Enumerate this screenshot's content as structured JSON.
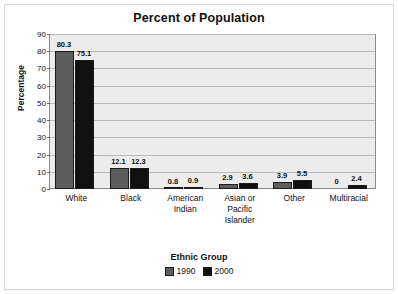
{
  "chart_data": {
    "type": "bar",
    "title": "Percent of Population",
    "xlabel": "Ethnic Group",
    "ylabel": "Percentage",
    "ylim": [
      0,
      90
    ],
    "yticks": [
      0,
      10,
      20,
      30,
      40,
      50,
      60,
      70,
      80,
      90
    ],
    "grid": true,
    "legend_position": "bottom",
    "categories": [
      "White",
      "Black",
      "American Indian",
      "Asian or Pacific Islander",
      "Other",
      "Multiracial"
    ],
    "category_lines": [
      [
        "White"
      ],
      [
        "Black"
      ],
      [
        "American",
        "Indian"
      ],
      [
        "Asian or",
        "Pacific",
        "Islander"
      ],
      [
        "Other"
      ],
      [
        "Multiracial"
      ]
    ],
    "series": [
      {
        "name": "1990",
        "color": "#5d5d5d",
        "values": [
          80.3,
          12.1,
          0.8,
          2.9,
          3.9,
          0
        ],
        "labels": [
          "80.3",
          "12.1",
          "0.8",
          "2.9",
          "3.9",
          "0"
        ]
      },
      {
        "name": "2000",
        "color": "#111111",
        "values": [
          75.1,
          12.3,
          0.9,
          3.6,
          5.5,
          2.4
        ],
        "labels": [
          "75.1",
          "12.3",
          "0.9",
          "3.6",
          "5.5",
          "2.4"
        ]
      }
    ]
  },
  "colors": {
    "series_1990": "#5d5d5d",
    "series_2000": "#111111",
    "plot_background": "#ececec",
    "gridline": "#b9b9b9",
    "axis": "#8a8a8a",
    "text": "#111111"
  }
}
